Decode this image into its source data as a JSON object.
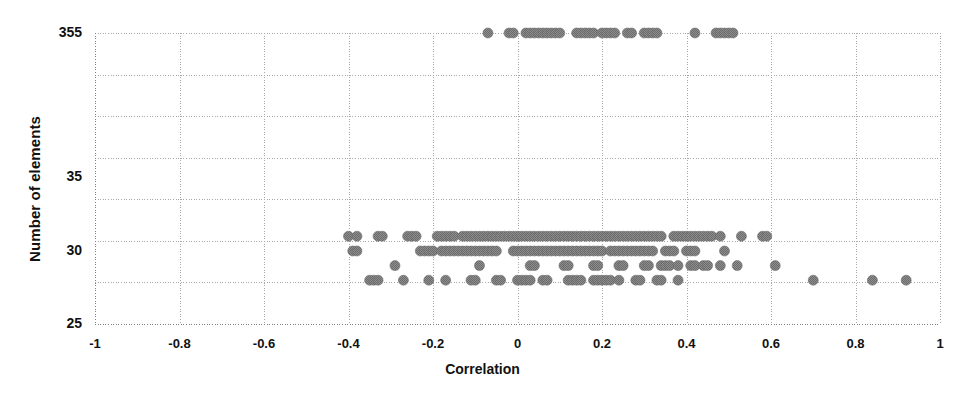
{
  "chart_data": {
    "type": "scatter",
    "title": "",
    "xlabel": "Correlation",
    "ylabel": "Number of elements",
    "xlim": [
      -1,
      1
    ],
    "xticks": [
      "-1",
      "-0.8",
      "-0.6",
      "-0.4",
      "-0.2",
      "0",
      "0.2",
      "0.4",
      "0.6",
      "0.8",
      "1"
    ],
    "xtick_values": [
      -1,
      -0.8,
      -0.6,
      -0.4,
      -0.2,
      0,
      0.2,
      0.4,
      0.6,
      0.8,
      1
    ],
    "yticks": [
      "355",
      "35",
      "30",
      "25"
    ],
    "ytick_values": [
      355,
      35,
      30,
      25
    ],
    "y_axis_note": "broken / non-linear axis: 355 at top, then 35, 30, 25",
    "grid": true,
    "gridlines_horizontal": 8,
    "gridlines_vertical": 11,
    "legend": "none",
    "marker": {
      "shape": "circle",
      "color": "#8a8a8a",
      "edge_color": "#6f6f6f",
      "size_px": 10,
      "texture": "dithered"
    },
    "series": [
      {
        "name": "clusters",
        "points": [
          [
            -0.07,
            355
          ],
          [
            -0.02,
            355
          ],
          [
            -0.01,
            355
          ],
          [
            0.02,
            355
          ],
          [
            0.03,
            355
          ],
          [
            0.04,
            355
          ],
          [
            0.05,
            355
          ],
          [
            0.06,
            355
          ],
          [
            0.07,
            355
          ],
          [
            0.08,
            355
          ],
          [
            0.09,
            355
          ],
          [
            0.1,
            355
          ],
          [
            0.14,
            355
          ],
          [
            0.15,
            355
          ],
          [
            0.16,
            355
          ],
          [
            0.17,
            355
          ],
          [
            0.18,
            355
          ],
          [
            0.2,
            355
          ],
          [
            0.21,
            355
          ],
          [
            0.22,
            355
          ],
          [
            0.23,
            355
          ],
          [
            0.26,
            355
          ],
          [
            0.27,
            355
          ],
          [
            0.3,
            355
          ],
          [
            0.31,
            355
          ],
          [
            0.32,
            355
          ],
          [
            0.33,
            355
          ],
          [
            0.42,
            355
          ],
          [
            0.47,
            355
          ],
          [
            0.48,
            355
          ],
          [
            0.49,
            355
          ],
          [
            0.5,
            355
          ],
          [
            0.51,
            355
          ],
          [
            -0.4,
            31
          ],
          [
            -0.38,
            31
          ],
          [
            -0.33,
            31
          ],
          [
            -0.32,
            31
          ],
          [
            -0.26,
            31
          ],
          [
            -0.25,
            31
          ],
          [
            -0.24,
            31
          ],
          [
            -0.19,
            31
          ],
          [
            -0.18,
            31
          ],
          [
            -0.17,
            31
          ],
          [
            -0.16,
            31
          ],
          [
            -0.15,
            31
          ],
          [
            -0.13,
            31
          ],
          [
            -0.12,
            31
          ],
          [
            -0.11,
            31
          ],
          [
            -0.1,
            31
          ],
          [
            -0.09,
            31
          ],
          [
            -0.08,
            31
          ],
          [
            -0.07,
            31
          ],
          [
            -0.06,
            31
          ],
          [
            -0.05,
            31
          ],
          [
            -0.04,
            31
          ],
          [
            -0.03,
            31
          ],
          [
            -0.02,
            31
          ],
          [
            -0.01,
            31
          ],
          [
            0.0,
            31
          ],
          [
            0.01,
            31
          ],
          [
            0.02,
            31
          ],
          [
            0.03,
            31
          ],
          [
            0.04,
            31
          ],
          [
            0.05,
            31
          ],
          [
            0.06,
            31
          ],
          [
            0.07,
            31
          ],
          [
            0.08,
            31
          ],
          [
            0.09,
            31
          ],
          [
            0.1,
            31
          ],
          [
            0.11,
            31
          ],
          [
            0.12,
            31
          ],
          [
            0.13,
            31
          ],
          [
            0.14,
            31
          ],
          [
            0.15,
            31
          ],
          [
            0.16,
            31
          ],
          [
            0.17,
            31
          ],
          [
            0.18,
            31
          ],
          [
            0.19,
            31
          ],
          [
            0.2,
            31
          ],
          [
            0.21,
            31
          ],
          [
            0.22,
            31
          ],
          [
            0.23,
            31
          ],
          [
            0.24,
            31
          ],
          [
            0.25,
            31
          ],
          [
            0.26,
            31
          ],
          [
            0.27,
            31
          ],
          [
            0.28,
            31
          ],
          [
            0.29,
            31
          ],
          [
            0.3,
            31
          ],
          [
            0.31,
            31
          ],
          [
            0.32,
            31
          ],
          [
            0.33,
            31
          ],
          [
            0.34,
            31
          ],
          [
            0.37,
            31
          ],
          [
            0.38,
            31
          ],
          [
            0.39,
            31
          ],
          [
            0.4,
            31
          ],
          [
            0.41,
            31
          ],
          [
            0.42,
            31
          ],
          [
            0.43,
            31
          ],
          [
            0.44,
            31
          ],
          [
            0.45,
            31
          ],
          [
            0.46,
            31
          ],
          [
            0.48,
            31
          ],
          [
            0.53,
            31
          ],
          [
            0.58,
            31
          ],
          [
            0.59,
            31
          ],
          [
            -0.39,
            30
          ],
          [
            -0.38,
            30
          ],
          [
            -0.23,
            30
          ],
          [
            -0.22,
            30
          ],
          [
            -0.21,
            30
          ],
          [
            -0.2,
            30
          ],
          [
            -0.18,
            30
          ],
          [
            -0.17,
            30
          ],
          [
            -0.16,
            30
          ],
          [
            -0.15,
            30
          ],
          [
            -0.14,
            30
          ],
          [
            -0.13,
            30
          ],
          [
            -0.12,
            30
          ],
          [
            -0.11,
            30
          ],
          [
            -0.1,
            30
          ],
          [
            -0.09,
            30
          ],
          [
            -0.08,
            30
          ],
          [
            -0.07,
            30
          ],
          [
            -0.06,
            30
          ],
          [
            -0.05,
            30
          ],
          [
            -0.01,
            30
          ],
          [
            0.0,
            30
          ],
          [
            0.01,
            30
          ],
          [
            0.02,
            30
          ],
          [
            0.03,
            30
          ],
          [
            0.04,
            30
          ],
          [
            0.05,
            30
          ],
          [
            0.06,
            30
          ],
          [
            0.07,
            30
          ],
          [
            0.08,
            30
          ],
          [
            0.09,
            30
          ],
          [
            0.1,
            30
          ],
          [
            0.11,
            30
          ],
          [
            0.12,
            30
          ],
          [
            0.13,
            30
          ],
          [
            0.14,
            30
          ],
          [
            0.15,
            30
          ],
          [
            0.16,
            30
          ],
          [
            0.17,
            30
          ],
          [
            0.18,
            30
          ],
          [
            0.19,
            30
          ],
          [
            0.2,
            30
          ],
          [
            0.22,
            30
          ],
          [
            0.23,
            30
          ],
          [
            0.24,
            30
          ],
          [
            0.25,
            30
          ],
          [
            0.26,
            30
          ],
          [
            0.27,
            30
          ],
          [
            0.28,
            30
          ],
          [
            0.29,
            30
          ],
          [
            0.3,
            30
          ],
          [
            0.31,
            30
          ],
          [
            0.32,
            30
          ],
          [
            0.35,
            30
          ],
          [
            0.36,
            30
          ],
          [
            0.37,
            30
          ],
          [
            0.4,
            30
          ],
          [
            0.41,
            30
          ],
          [
            0.42,
            30
          ],
          [
            0.49,
            30
          ],
          [
            -0.29,
            29
          ],
          [
            -0.09,
            29
          ],
          [
            0.03,
            29
          ],
          [
            0.04,
            29
          ],
          [
            0.11,
            29
          ],
          [
            0.12,
            29
          ],
          [
            0.18,
            29
          ],
          [
            0.19,
            29
          ],
          [
            0.24,
            29
          ],
          [
            0.25,
            29
          ],
          [
            0.3,
            29
          ],
          [
            0.31,
            29
          ],
          [
            0.34,
            29
          ],
          [
            0.35,
            29
          ],
          [
            0.36,
            29
          ],
          [
            0.38,
            29
          ],
          [
            0.41,
            29
          ],
          [
            0.42,
            29
          ],
          [
            0.44,
            29
          ],
          [
            0.45,
            29
          ],
          [
            0.48,
            29
          ],
          [
            0.52,
            29
          ],
          [
            0.61,
            29
          ],
          [
            -0.35,
            28
          ],
          [
            -0.34,
            28
          ],
          [
            -0.33,
            28
          ],
          [
            -0.27,
            28
          ],
          [
            -0.21,
            28
          ],
          [
            -0.17,
            28
          ],
          [
            -0.11,
            28
          ],
          [
            -0.1,
            28
          ],
          [
            -0.05,
            28
          ],
          [
            -0.04,
            28
          ],
          [
            0.0,
            28
          ],
          [
            0.01,
            28
          ],
          [
            0.02,
            28
          ],
          [
            0.03,
            28
          ],
          [
            0.06,
            28
          ],
          [
            0.07,
            28
          ],
          [
            0.12,
            28
          ],
          [
            0.13,
            28
          ],
          [
            0.14,
            28
          ],
          [
            0.15,
            28
          ],
          [
            0.18,
            28
          ],
          [
            0.19,
            28
          ],
          [
            0.2,
            28
          ],
          [
            0.21,
            28
          ],
          [
            0.22,
            28
          ],
          [
            0.24,
            28
          ],
          [
            0.28,
            28
          ],
          [
            0.29,
            28
          ],
          [
            0.33,
            28
          ],
          [
            0.34,
            28
          ],
          [
            0.38,
            28
          ],
          [
            0.7,
            28
          ],
          [
            0.84,
            28
          ],
          [
            0.92,
            28
          ]
        ]
      }
    ]
  },
  "colors": {
    "marker": "#8a8a8a",
    "marker_edge": "#6f6f6f",
    "grid": "#a8a8a8",
    "axis": "#808080",
    "text": "#111111",
    "background": "#ffffff"
  }
}
